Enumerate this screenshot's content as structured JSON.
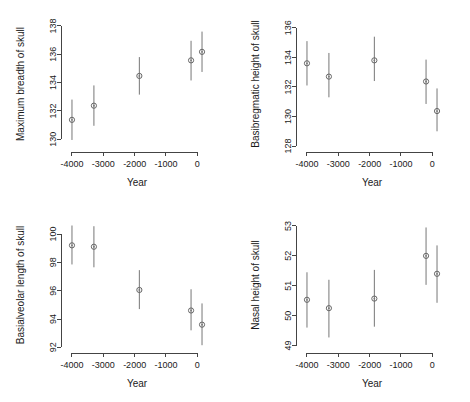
{
  "figure": {
    "layout": "2x2 panel grid",
    "shared_xlabel": "Year"
  },
  "chart_data": [
    {
      "type": "scatter",
      "panel": "top-left",
      "title": "",
      "xlabel": "Year",
      "ylabel": "Maximum breadth of skull",
      "x": [
        -4000,
        -3300,
        -1850,
        -200,
        150
      ],
      "values": [
        131.37,
        132.37,
        134.47,
        135.57,
        136.17
      ],
      "err_low": [
        129.95,
        130.95,
        133.15,
        134.15,
        134.75
      ],
      "err_high": [
        132.8,
        133.8,
        135.8,
        136.95,
        137.6
      ],
      "xlim": [
        -4350,
        500
      ],
      "ylim": [
        129.1,
        138.7
      ],
      "xticks": [
        -4000,
        -3000,
        -2000,
        -1000,
        0
      ],
      "xticklabels": [
        "-4000",
        "-3000",
        "-2000",
        "-1000",
        "0"
      ],
      "yticks": [
        130,
        132,
        134,
        136,
        138
      ],
      "yticklabels": [
        "130",
        "132",
        "134",
        "136",
        "138"
      ],
      "grid": false,
      "legend": "none"
    },
    {
      "type": "scatter",
      "panel": "top-right",
      "title": "",
      "xlabel": "Year",
      "ylabel": "Basibregmatic height of skull",
      "x": [
        -4000,
        -3300,
        -1850,
        -200,
        150
      ],
      "values": [
        133.6,
        132.7,
        133.8,
        132.37,
        130.37
      ],
      "err_low": [
        132.1,
        131.3,
        132.4,
        130.85,
        129.0
      ],
      "err_high": [
        135.1,
        134.3,
        135.4,
        133.85,
        131.9
      ],
      "xlim": [
        -4350,
        500
      ],
      "ylim": [
        127.6,
        136.8
      ],
      "xticks": [
        -4000,
        -3000,
        -2000,
        -1000,
        0
      ],
      "xticklabels": [
        "-4000",
        "-3000",
        "-2000",
        "-1000",
        "0"
      ],
      "yticks": [
        128,
        130,
        132,
        134,
        136
      ],
      "yticklabels": [
        "128",
        "130",
        "132",
        "134",
        "136"
      ],
      "grid": false,
      "legend": "none"
    },
    {
      "type": "scatter",
      "panel": "bottom-left",
      "title": "",
      "xlabel": "Year",
      "ylabel": "Basialveolar length of skull",
      "x": [
        -4000,
        -3300,
        -1850,
        -200,
        150
      ],
      "values": [
        99.2,
        99.1,
        96.05,
        94.6,
        93.6
      ],
      "err_low": [
        97.85,
        97.65,
        94.7,
        93.2,
        92.15
      ],
      "err_high": [
        100.6,
        100.55,
        97.45,
        96.1,
        95.1
      ],
      "xlim": [
        -4350,
        500
      ],
      "ylim": [
        91.6,
        101.2
      ],
      "xticks": [
        -4000,
        -3000,
        -2000,
        -1000,
        0
      ],
      "xticklabels": [
        "-4000",
        "-3000",
        "-2000",
        "-1000",
        "0"
      ],
      "yticks": [
        92,
        94,
        96,
        98,
        100
      ],
      "yticklabels": [
        "92",
        "94",
        "96",
        "98",
        "100"
      ],
      "grid": false,
      "legend": "none"
    },
    {
      "type": "scatter",
      "panel": "bottom-right",
      "title": "",
      "xlabel": "Year",
      "ylabel": "Nasal height of skull",
      "x": [
        -4000,
        -3300,
        -1850,
        -200,
        150
      ],
      "values": [
        50.53,
        50.25,
        50.57,
        52.0,
        51.4
      ],
      "err_low": [
        49.6,
        49.27,
        49.63,
        51.03,
        50.43
      ],
      "err_high": [
        51.45,
        51.2,
        51.53,
        52.95,
        52.35
      ],
      "xlim": [
        -4350,
        500
      ],
      "ylim": [
        48.75,
        53.3
      ],
      "xticks": [
        -4000,
        -3000,
        -2000,
        -1000,
        0
      ],
      "xticklabels": [
        "-4000",
        "-3000",
        "-2000",
        "-1000",
        "0"
      ],
      "yticks": [
        49,
        50,
        51,
        52,
        53
      ],
      "yticklabels": [
        "49",
        "50",
        "51",
        "52",
        "53"
      ],
      "grid": false,
      "legend": "none"
    }
  ]
}
